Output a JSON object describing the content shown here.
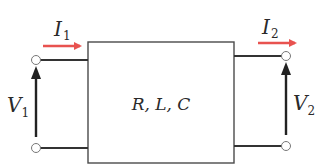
{
  "figure": {
    "type": "two-port network",
    "block_label": "R, L, C",
    "ports": [
      {
        "side": "input",
        "current": {
          "symbol": "I",
          "subscript": "1",
          "direction": "into network"
        },
        "voltage": {
          "symbol": "V",
          "subscript": "1",
          "direction": "up"
        }
      },
      {
        "side": "output",
        "current": {
          "symbol": "I",
          "subscript": "2",
          "direction": "out of network"
        },
        "voltage": {
          "symbol": "V",
          "subscript": "2",
          "direction": "up"
        }
      }
    ]
  },
  "colors": {
    "current_arrow": "#e8524f",
    "voltage_arrow": "#222222",
    "wire": "#333333",
    "box": "#4a4a4a",
    "terminal": "#777777"
  }
}
